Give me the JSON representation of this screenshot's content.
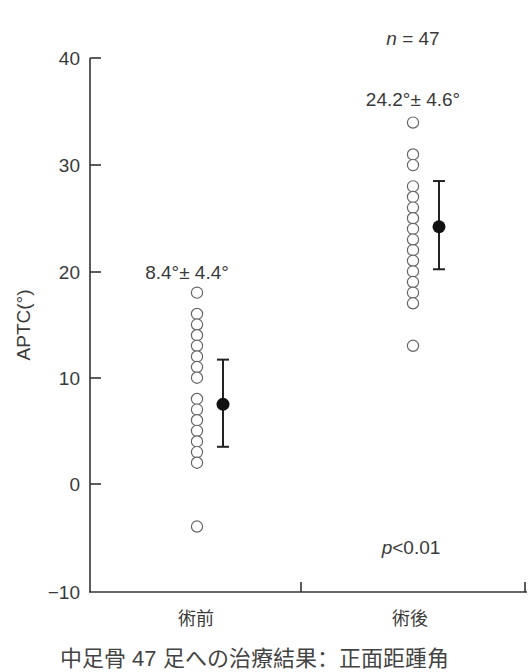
{
  "chart_data": {
    "type": "scatter",
    "subtype": "dot-plot with mean ± SD",
    "title": "",
    "xlabel": "",
    "ylabel": "APTC(°)",
    "ylim": [
      -10,
      40
    ],
    "yticks": [
      40,
      30,
      20,
      10,
      0,
      -10
    ],
    "ytick_labels": [
      "40",
      "30",
      "20",
      "10",
      "0",
      "−10"
    ],
    "grid": false,
    "categories": [
      "術前",
      "術後"
    ],
    "series": [
      {
        "name": "術前",
        "points": [
          18,
          16,
          15,
          14,
          13,
          12,
          11,
          10,
          8,
          7,
          6,
          5,
          4,
          3,
          2,
          -4
        ],
        "mean": 7.5,
        "sd_low": 3.5,
        "sd_high": 11.7,
        "label": "8.4°± 4.4°"
      },
      {
        "name": "術後",
        "points": [
          34,
          31,
          30,
          28,
          27,
          26,
          25,
          24,
          23,
          22,
          21,
          20,
          19,
          18,
          17,
          13
        ],
        "mean": 24.2,
        "sd_low": 20.2,
        "sd_high": 28.5,
        "label": "24.2°± 4.6°"
      }
    ],
    "annotations": {
      "n": "n = 47",
      "n_italic": "n",
      "n_rest": " = 47",
      "p": "p<0.01",
      "p_italic": "p",
      "p_rest": "<0.01"
    }
  },
  "caption": "中足骨 47 足への治療結果：正面距踵角"
}
